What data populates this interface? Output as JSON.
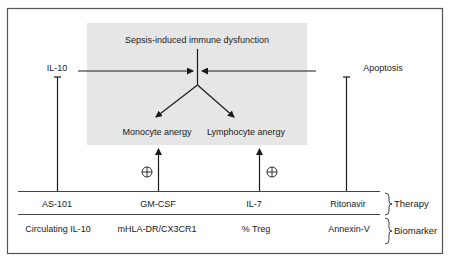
{
  "diagram": {
    "title": "Sepsis-induced immune dysfunction",
    "inputs": {
      "left": "IL-10",
      "right": "Apoptosis"
    },
    "outcomes": {
      "left": "Monocyte anergy",
      "right": "Lymphocyte anergy"
    },
    "activation_symbol": "⊕",
    "rows": [
      {
        "category": "Therapy",
        "cells": [
          "AS-101",
          "GM-CSF",
          "IL-7",
          "Ritonavir"
        ]
      },
      {
        "category": "Biomarker",
        "cells": [
          "Circulating IL-10",
          "mHLA-DR/CX3CR1",
          "% Treg",
          "Annexin-V"
        ]
      }
    ],
    "colors": {
      "panel_fill": "#e6e6e6",
      "line": "#1a1a1a",
      "frame": "#555555"
    }
  }
}
